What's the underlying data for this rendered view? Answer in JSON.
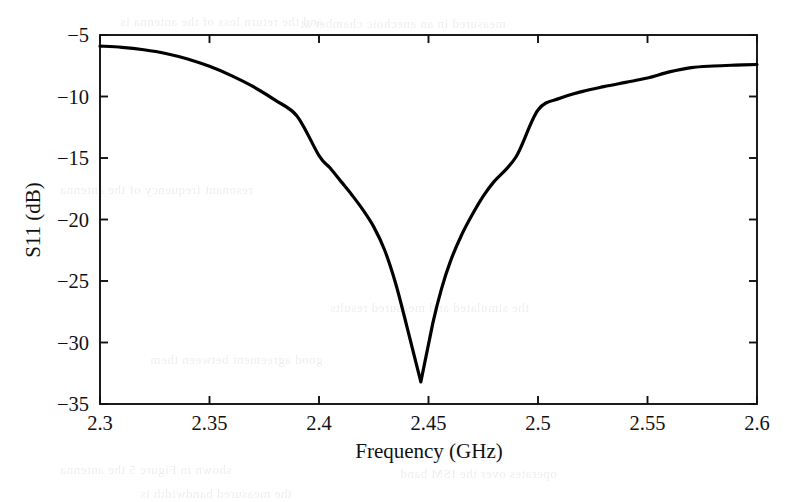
{
  "figure": {
    "kind": "line-plot",
    "background_color": "#ffffff",
    "ink_color": "#111111",
    "curve_color": "#000000"
  },
  "bleed_through": {
    "note": "faint mirrored text showing through from the reverse side of the scanned page",
    "lines": [
      {
        "text": "and the return loss of the antenna is",
        "x": 120,
        "y": 14,
        "size": 13
      },
      {
        "text": "measured in an anechoic chamber at",
        "x": 300,
        "y": 16,
        "size": 13
      },
      {
        "text": "resonant frequency of the antenna",
        "x": 60,
        "y": 182,
        "size": 13
      },
      {
        "text": "the simulated and measured results",
        "x": 330,
        "y": 300,
        "size": 13
      },
      {
        "text": "good agreement between them",
        "x": 150,
        "y": 352,
        "size": 13
      },
      {
        "text": "shown in Figure 5 the antenna",
        "x": 60,
        "y": 462,
        "size": 13
      },
      {
        "text": "operates over the ISM band",
        "x": 400,
        "y": 466,
        "size": 13
      },
      {
        "text": "the measured bandwidth is",
        "x": 140,
        "y": 486,
        "size": 13
      }
    ]
  },
  "chart_data": {
    "type": "line",
    "title": "",
    "subtitle": "",
    "xlabel": "Frequency (GHz)",
    "ylabel": "S11 (dB)",
    "xlim": [
      2.3,
      2.6
    ],
    "ylim": [
      -35,
      -5
    ],
    "grid": false,
    "legend": null,
    "legend_position": "none",
    "xticks": [
      2.3,
      2.35,
      2.4,
      2.45,
      2.5,
      2.55,
      2.6
    ],
    "xtick_labels": [
      "2.3",
      "2.35",
      "2.4",
      "2.45",
      "2.5",
      "2.55",
      "2.6"
    ],
    "yticks": [
      -35,
      -30,
      -25,
      -20,
      -15,
      -10,
      -5
    ],
    "ytick_labels": [
      "−35",
      "−30",
      "−25",
      "−20",
      "−15",
      "−10",
      "−5"
    ],
    "minimum": {
      "x": 2.4465,
      "y": -33.2,
      "label": "resonance dip"
    },
    "series": [
      {
        "name": "S11",
        "color": "#000000",
        "line_width": 3.2,
        "x": [
          2.3,
          2.31,
          2.32,
          2.33,
          2.34,
          2.35,
          2.36,
          2.37,
          2.38,
          2.39,
          2.4,
          2.405,
          2.41,
          2.415,
          2.42,
          2.425,
          2.43,
          2.435,
          2.44,
          2.4465,
          2.452,
          2.456,
          2.46,
          2.465,
          2.47,
          2.475,
          2.48,
          2.49,
          2.5,
          2.51,
          2.52,
          2.53,
          2.54,
          2.55,
          2.56,
          2.57,
          2.58,
          2.59,
          2.6
        ],
        "y": [
          -5.9,
          -6.0,
          -6.2,
          -6.5,
          -6.95,
          -7.55,
          -8.3,
          -9.2,
          -10.3,
          -11.6,
          -14.8,
          -15.8,
          -16.9,
          -18.0,
          -19.2,
          -20.6,
          -22.5,
          -25.2,
          -28.6,
          -33.2,
          -28.4,
          -25.6,
          -23.4,
          -21.3,
          -19.6,
          -18.1,
          -16.9,
          -14.9,
          -11.1,
          -10.15,
          -9.6,
          -9.2,
          -8.85,
          -8.5,
          -8.0,
          -7.65,
          -7.52,
          -7.45,
          -7.4
        ]
      }
    ]
  }
}
